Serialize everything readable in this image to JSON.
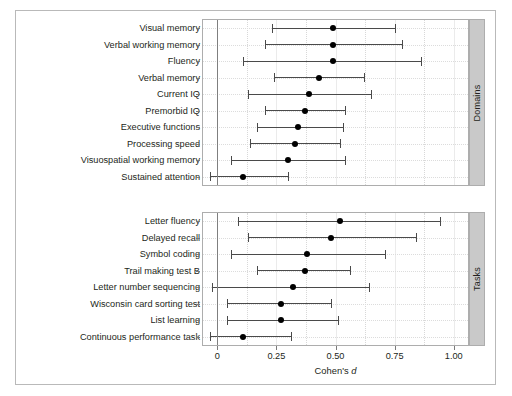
{
  "figure": {
    "x_axis_title": "Cohen's",
    "x_axis_title_italic": "d",
    "x_ticks": [
      {
        "value": 0,
        "label": "0"
      },
      {
        "value": 0.25,
        "label": "0.25"
      },
      {
        "value": 0.5,
        "label": "0.50"
      },
      {
        "value": 0.75,
        "label": "0.75"
      },
      {
        "value": 1.0,
        "label": "1.00"
      }
    ],
    "panels": [
      {
        "strip_label": "Domains"
      },
      {
        "strip_label": "Tasks"
      }
    ]
  },
  "chart_data": {
    "type": "scatter",
    "title": "",
    "subtitle": "",
    "xlabel": "Cohen's d",
    "ylabel": "",
    "xlim": [
      -0.06,
      1.06
    ],
    "xticks": [
      0,
      0.25,
      0.5,
      0.75,
      1.0
    ],
    "xticklabels": [
      "0",
      "0.25",
      "0.50",
      "0.75",
      "1.00"
    ],
    "grid": true,
    "grid_orientation": "both",
    "legend": "none",
    "reference_line": 0,
    "error_bar_type": "95% confidence interval",
    "panels": [
      {
        "name": "Domains",
        "points": [
          {
            "label": "Visual memory",
            "d": 0.49,
            "ci_low": 0.23,
            "ci_high": 0.75
          },
          {
            "label": "Verbal working memory",
            "d": 0.49,
            "ci_low": 0.2,
            "ci_high": 0.78
          },
          {
            "label": "Fluency",
            "d": 0.49,
            "ci_low": 0.11,
            "ci_high": 0.86
          },
          {
            "label": "Verbal memory",
            "d": 0.43,
            "ci_low": 0.24,
            "ci_high": 0.62
          },
          {
            "label": "Current IQ",
            "d": 0.39,
            "ci_low": 0.13,
            "ci_high": 0.65
          },
          {
            "label": "Premorbid IQ",
            "d": 0.37,
            "ci_low": 0.2,
            "ci_high": 0.54
          },
          {
            "label": "Executive functions",
            "d": 0.34,
            "ci_low": 0.17,
            "ci_high": 0.53
          },
          {
            "label": "Processing speed",
            "d": 0.33,
            "ci_low": 0.14,
            "ci_high": 0.52
          },
          {
            "label": "Visuospatial working memory",
            "d": 0.3,
            "ci_low": 0.06,
            "ci_high": 0.54
          },
          {
            "label": "Sustained attention",
            "d": 0.11,
            "ci_low": -0.03,
            "ci_high": 0.3
          }
        ]
      },
      {
        "name": "Tasks",
        "points": [
          {
            "label": "Letter fluency",
            "d": 0.52,
            "ci_low": 0.09,
            "ci_high": 0.94
          },
          {
            "label": "Delayed recall",
            "d": 0.48,
            "ci_low": 0.13,
            "ci_high": 0.84
          },
          {
            "label": "Symbol coding",
            "d": 0.38,
            "ci_low": 0.06,
            "ci_high": 0.71
          },
          {
            "label": "Trail making test B",
            "d": 0.37,
            "ci_low": 0.17,
            "ci_high": 0.56
          },
          {
            "label": "Letter number sequencing",
            "d": 0.32,
            "ci_low": -0.02,
            "ci_high": 0.64
          },
          {
            "label": "Wisconsin card sorting test",
            "d": 0.27,
            "ci_low": 0.04,
            "ci_high": 0.48
          },
          {
            "label": "List learning",
            "d": 0.27,
            "ci_low": 0.04,
            "ci_high": 0.51
          },
          {
            "label": "Continuous performance task",
            "d": 0.11,
            "ci_low": -0.03,
            "ci_high": 0.31
          }
        ]
      }
    ]
  }
}
